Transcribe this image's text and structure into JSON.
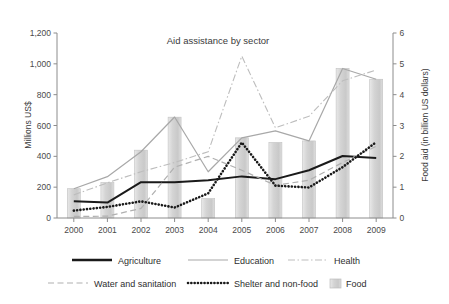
{
  "chart_data": {
    "type": "line",
    "title": "Aid assistance by sector",
    "xlabel": "",
    "ylabel": "Millions US$",
    "y2label": "Food aid (in billion US dollars)",
    "categories": [
      "2000",
      "2001",
      "2002",
      "2003",
      "2004",
      "2005",
      "2006",
      "2007",
      "2008",
      "2009"
    ],
    "ylim": [
      0,
      1200
    ],
    "y2lim": [
      0,
      6
    ],
    "yticks": [
      "0",
      "200",
      "400",
      "600",
      "800",
      "1,000",
      "1,200"
    ],
    "ytick_values": [
      0,
      200,
      400,
      600,
      800,
      1000,
      1200
    ],
    "y2ticks": [
      "0",
      "1",
      "2",
      "3",
      "4",
      "5",
      "6"
    ],
    "y2tick_values": [
      0,
      1,
      2,
      3,
      4,
      5,
      6
    ],
    "grid": false,
    "legend_position": "bottom",
    "series": [
      {
        "name": "Agriculture",
        "style": "solid",
        "color": "#1a1a1a",
        "axis": "left",
        "values": [
          108,
          100,
          232,
          232,
          245,
          270,
          252,
          310,
          402,
          390
        ]
      },
      {
        "name": "Education",
        "style": "solid",
        "color": "#a8a8a8",
        "axis": "left",
        "values": [
          190,
          268,
          430,
          655,
          300,
          520,
          565,
          500,
          970,
          900
        ]
      },
      {
        "name": "Health",
        "style": "dash-dot",
        "color": "#bdbdbd",
        "axis": "left",
        "values": [
          150,
          228,
          300,
          360,
          430,
          1050,
          585,
          660,
          890,
          960
        ]
      },
      {
        "name": "Water and sanitation",
        "style": "dashed",
        "color": "#b0b0b0",
        "axis": "left",
        "values": [
          10,
          12,
          62,
          330,
          400,
          310,
          212,
          245,
          360,
          465
        ]
      },
      {
        "name": "Shelter and non-food",
        "style": "dotted",
        "color": "#1a1a1a",
        "axis": "left",
        "values": [
          48,
          72,
          108,
          68,
          160,
          490,
          210,
          198,
          330,
          492
        ]
      },
      {
        "name": "Food",
        "style": "bar",
        "color": "#d0d0d0",
        "axis": "right",
        "values": [
          0.95,
          1.15,
          2.2,
          3.27,
          0.63,
          2.6,
          2.45,
          2.5,
          4.85,
          4.5
        ]
      }
    ]
  },
  "legend": {
    "items": [
      {
        "label": "Agriculture",
        "marker": "line-solid-black"
      },
      {
        "label": "Education",
        "marker": "line-solid-gray"
      },
      {
        "label": "Health",
        "marker": "line-dashdot-gray"
      },
      {
        "label": "Water and sanitation",
        "marker": "line-dashed-gray"
      },
      {
        "label": "Shelter and non-food",
        "marker": "line-dotted-black"
      },
      {
        "label": "Food",
        "marker": "bar-swatch-gray"
      }
    ]
  },
  "colors": {
    "black_line": "#1a1a1a",
    "gray_line": "#a8a8a8",
    "light_gray_line": "#bdbdbd",
    "bar_fill": "#d0d0d0",
    "axis": "#8c8c8c",
    "text": "#3b3b3b",
    "background": "#ffffff"
  }
}
